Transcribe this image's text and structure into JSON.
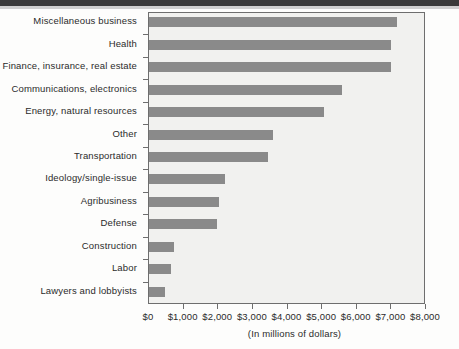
{
  "chart_data": {
    "type": "bar",
    "orientation": "horizontal",
    "title": "",
    "xlabel": "(In millions of dollars)",
    "ylabel": "",
    "xlim": [
      0,
      8000
    ],
    "xtick_labels": [
      "$0",
      "$1,000",
      "$2,000",
      "$3,000",
      "$4,000",
      "$5,000",
      "$6,000",
      "$7,000",
      "$8,000"
    ],
    "xtick_values": [
      0,
      1000,
      2000,
      3000,
      4000,
      5000,
      6000,
      7000,
      8000
    ],
    "grid": false,
    "legend": null,
    "bar_color": "#8a8a8a",
    "plot_background": "#f1f1ef",
    "categories": [
      "Miscellaneous business",
      "Health",
      "Finance, insurance, real estate",
      "Communications, electronics",
      "Energy, natural resources",
      "Other",
      "Transportation",
      "Ideology/single-issue",
      "Agribusiness",
      "Defense",
      "Construction",
      "Labor",
      "Lawyers and lobbyists"
    ],
    "values": [
      7150,
      7000,
      6980,
      5570,
      5050,
      3580,
      3440,
      2200,
      2030,
      1970,
      725,
      640,
      460
    ]
  }
}
